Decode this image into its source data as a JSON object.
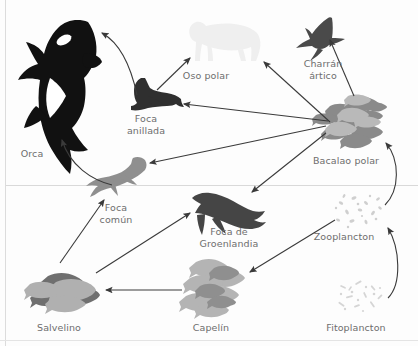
{
  "diagram": {
    "language": "es",
    "waterline_y": 185,
    "colors": {
      "background": "#fdfdfd",
      "label_text": "#6d6d6d",
      "arrow": "#3a3a3a",
      "waterline": "#d9d9d9",
      "border": "#dcdcdc",
      "orca_black": "#111111",
      "tern_dark": "#4a4a4a",
      "ringed_seal_dark": "#2f2f2f",
      "harp_seal_dark": "#454545",
      "common_seal_gray": "#8f8f8f",
      "polar_bear_light": "#efefef",
      "polar_cod_gray": "#8a8a8a",
      "arctic_char_gray": "#9a9a9a",
      "capelin_gray": "#b4b4b4",
      "zooplankton_light": "#cfcfcf",
      "phytoplankton_light": "#d5d5d5"
    }
  },
  "organisms": [
    {
      "id": "orca",
      "label": "Orca",
      "label_x": 20,
      "label_y": 148,
      "zone": "above-water"
    },
    {
      "id": "ringed_seal",
      "label": "Foca\nanillada",
      "label_x": 116,
      "label_y": 113,
      "zone": "above-water"
    },
    {
      "id": "polar_bear",
      "label": "Oso polar",
      "label_x": 204,
      "label_y": 70,
      "zone": "above-water"
    },
    {
      "id": "arctic_tern",
      "label": "Charrán\nártico",
      "label_x": 305,
      "label_y": 58,
      "zone": "above-water"
    },
    {
      "id": "polar_cod",
      "label": "Bacalao polar",
      "label_x": 333,
      "label_y": 155,
      "zone": "above-water"
    },
    {
      "id": "common_seal",
      "label": "Foca\ncomún",
      "label_x": 101,
      "label_y": 202,
      "zone": "below-water"
    },
    {
      "id": "harp_seal",
      "label": "Foca de\nGroenlandia",
      "label_x": 206,
      "label_y": 226,
      "zone": "below-water"
    },
    {
      "id": "zooplankton",
      "label": "Zooplancton",
      "label_x": 331,
      "label_y": 231,
      "zone": "below-water"
    },
    {
      "id": "arctic_char",
      "label": "Salvelino",
      "label_x": 38,
      "label_y": 322,
      "zone": "below-water"
    },
    {
      "id": "capelin",
      "label": "Capelín",
      "label_x": 194,
      "label_y": 322,
      "zone": "below-water"
    },
    {
      "id": "phytoplankton",
      "label": "Fitoplancton",
      "label_x": 333,
      "label_y": 322,
      "zone": "below-water"
    }
  ],
  "food_web_links": [
    {
      "from": "ringed_seal",
      "to": "orca",
      "style": "curved"
    },
    {
      "from": "common_seal",
      "to": "orca",
      "style": "curved"
    },
    {
      "from": "ringed_seal",
      "to": "polar_bear",
      "style": "straight"
    },
    {
      "from": "polar_cod",
      "to": "polar_bear",
      "style": "straight"
    },
    {
      "from": "polar_cod",
      "to": "arctic_tern",
      "style": "straight"
    },
    {
      "from": "polar_cod",
      "to": "ringed_seal",
      "style": "straight"
    },
    {
      "from": "polar_cod",
      "to": "common_seal",
      "style": "straight"
    },
    {
      "from": "polar_cod",
      "to": "harp_seal",
      "style": "straight"
    },
    {
      "from": "arctic_char",
      "to": "common_seal",
      "style": "straight"
    },
    {
      "from": "arctic_char",
      "to": "harp_seal",
      "style": "straight"
    },
    {
      "from": "capelin",
      "to": "arctic_char",
      "style": "straight"
    },
    {
      "from": "zooplankton",
      "to": "capelin",
      "style": "straight"
    },
    {
      "from": "zooplankton",
      "to": "polar_cod",
      "style": "curved"
    },
    {
      "from": "phytoplankton",
      "to": "zooplankton",
      "style": "curved"
    }
  ]
}
